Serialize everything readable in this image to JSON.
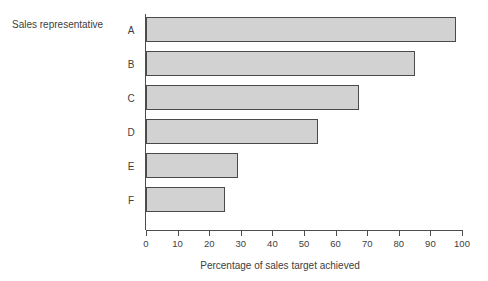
{
  "chart_data": {
    "type": "bar",
    "orientation": "horizontal",
    "title": "",
    "xlabel": "Percentage of sales target achieved",
    "ylabel": "Sales representative",
    "categories": [
      "A",
      "B",
      "C",
      "D",
      "E",
      "F"
    ],
    "values": [
      98,
      85,
      67.5,
      54.5,
      29,
      25
    ],
    "xlim": [
      0,
      100
    ],
    "xticks": [
      0,
      10,
      20,
      30,
      40,
      50,
      60,
      70,
      80,
      90,
      100
    ],
    "xtick_labels": [
      "0",
      "10",
      "20",
      "30",
      "40",
      "50",
      "60",
      "70",
      "80",
      "90",
      "100"
    ],
    "grid": false,
    "legend": null,
    "series": [
      {
        "name": "Percentage of sales target achieved",
        "values": [
          98,
          85,
          67.5,
          54.5,
          29,
          25
        ]
      }
    ],
    "colors": {
      "bar_fill": "#d2d2d2",
      "bar_border": "#4a4a4a",
      "axis": "#4d4d4d",
      "text": "#404040",
      "background": "#ffffff"
    }
  }
}
